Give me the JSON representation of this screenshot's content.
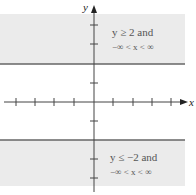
{
  "figure": {
    "axes": {
      "x_label": "x",
      "y_label": "y",
      "x_ticks": [
        -4,
        -3,
        -2,
        -1,
        1,
        2,
        3,
        4
      ],
      "y_ticks": [
        -4,
        -3,
        -2,
        -1,
        1,
        2,
        3,
        4
      ]
    },
    "regions": [
      {
        "name": "upper-region",
        "condition_line1": "y ≥ 2 and",
        "condition_line2": "−∞ < x < ∞",
        "boundary_y": 2,
        "fill": "#ebebeb"
      },
      {
        "name": "lower-region",
        "condition_line1": "y ≤ −2 and",
        "condition_line2": "−∞ < x < ∞",
        "boundary_y": -2,
        "fill": "#ebebeb"
      }
    ],
    "colors": {
      "axis": "#444444",
      "boundary": "#666666",
      "shade": "#ebebeb",
      "text": "#555555"
    }
  }
}
